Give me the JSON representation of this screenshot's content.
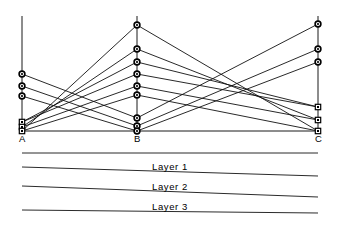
{
  "figure": {
    "type": "parallel-coordinates",
    "background_color": "#ffffff",
    "line_color": "#111111",
    "marker_color": "#000000",
    "width": 340,
    "height": 227
  },
  "axes": [
    {
      "id": "A",
      "label": "A",
      "x": 22,
      "top": 16,
      "bottom": 131
    },
    {
      "id": "B",
      "label": "B",
      "x": 137,
      "top": 16,
      "bottom": 131
    },
    {
      "id": "C",
      "label": "C",
      "x": 318,
      "top": 16,
      "bottom": 131
    }
  ],
  "baseline": {
    "y": 131,
    "x_start": 22,
    "x_end": 318
  },
  "markers": {
    "A": [
      {
        "y": 74,
        "shape": "circle"
      },
      {
        "y": 86,
        "shape": "circle"
      },
      {
        "y": 96,
        "shape": "circle"
      },
      {
        "y": 122,
        "shape": "square"
      },
      {
        "y": 127,
        "shape": "square"
      },
      {
        "y": 131,
        "shape": "square"
      }
    ],
    "B": [
      {
        "y": 25,
        "shape": "circle"
      },
      {
        "y": 49,
        "shape": "circle"
      },
      {
        "y": 62,
        "shape": "circle"
      },
      {
        "y": 74,
        "shape": "circle"
      },
      {
        "y": 86,
        "shape": "circle"
      },
      {
        "y": 95,
        "shape": "circle"
      },
      {
        "y": 118,
        "shape": "circle"
      },
      {
        "y": 126,
        "shape": "circle"
      },
      {
        "y": 131,
        "shape": "circle"
      }
    ],
    "C": [
      {
        "y": 24,
        "shape": "circle"
      },
      {
        "y": 49,
        "shape": "circle"
      },
      {
        "y": 62,
        "shape": "circle"
      },
      {
        "y": 107,
        "shape": "square"
      },
      {
        "y": 120,
        "shape": "square"
      },
      {
        "y": 131,
        "shape": "square"
      }
    ]
  },
  "series": [
    {
      "name": "s1",
      "points": [
        {
          "axis": "A",
          "y": 74
        },
        {
          "axis": "B",
          "y": 118
        },
        {
          "axis": "C",
          "y": 24
        }
      ]
    },
    {
      "name": "s2",
      "points": [
        {
          "axis": "A",
          "y": 86
        },
        {
          "axis": "B",
          "y": 126
        },
        {
          "axis": "C",
          "y": 49
        }
      ]
    },
    {
      "name": "s3",
      "points": [
        {
          "axis": "A",
          "y": 96
        },
        {
          "axis": "B",
          "y": 131
        },
        {
          "axis": "C",
          "y": 62
        }
      ]
    },
    {
      "name": "s4",
      "points": [
        {
          "axis": "A",
          "y": 122
        },
        {
          "axis": "B",
          "y": 74
        },
        {
          "axis": "C",
          "y": 107
        }
      ]
    },
    {
      "name": "s5",
      "points": [
        {
          "axis": "A",
          "y": 127
        },
        {
          "axis": "B",
          "y": 86
        },
        {
          "axis": "C",
          "y": 120
        }
      ]
    },
    {
      "name": "s6",
      "points": [
        {
          "axis": "A",
          "y": 131
        },
        {
          "axis": "B",
          "y": 95
        },
        {
          "axis": "C",
          "y": 131
        }
      ]
    },
    {
      "name": "s7",
      "points": [
        {
          "axis": "A",
          "y": 131
        },
        {
          "axis": "B",
          "y": 25
        },
        {
          "axis": "C",
          "y": 131
        }
      ]
    },
    {
      "name": "s8",
      "points": [
        {
          "axis": "A",
          "y": 127
        },
        {
          "axis": "B",
          "y": 49
        },
        {
          "axis": "C",
          "y": 120
        }
      ]
    },
    {
      "name": "s9",
      "points": [
        {
          "axis": "A",
          "y": 122
        },
        {
          "axis": "B",
          "y": 62
        },
        {
          "axis": "C",
          "y": 107
        }
      ]
    }
  ],
  "layers": [
    {
      "label": "Layer  1",
      "text_x": 110,
      "text_y": 161
    },
    {
      "label": "Layer  2",
      "text_x": 110,
      "text_y": 181
    },
    {
      "label": "Layer  3",
      "text_x": 110,
      "text_y": 201
    }
  ],
  "layer_rules": [
    {
      "x1": 22,
      "y1": 153,
      "x2": 318,
      "y2": 153
    },
    {
      "x1": 22,
      "y1": 167,
      "x2": 318,
      "y2": 176
    },
    {
      "x1": 22,
      "y1": 186,
      "x2": 318,
      "y2": 197
    },
    {
      "x1": 22,
      "y1": 210,
      "x2": 318,
      "y2": 213
    }
  ]
}
